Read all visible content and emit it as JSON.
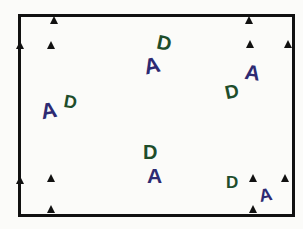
{
  "diagram": {
    "frame": {
      "left": 18,
      "top": 14,
      "width": 271,
      "height": 197,
      "color": "#111111"
    },
    "colors": {
      "A": "#2d2a72",
      "D": "#1e4d2b"
    },
    "markers": [
      {
        "x": 54,
        "y": 16
      },
      {
        "x": 20,
        "y": 41
      },
      {
        "x": 51,
        "y": 41
      },
      {
        "x": 249,
        "y": 16
      },
      {
        "x": 288,
        "y": 40
      },
      {
        "x": 250,
        "y": 40
      },
      {
        "x": 20,
        "y": 176
      },
      {
        "x": 51,
        "y": 174
      },
      {
        "x": 51,
        "y": 205
      },
      {
        "x": 253,
        "y": 174
      },
      {
        "x": 285,
        "y": 174
      },
      {
        "x": 253,
        "y": 205
      }
    ],
    "letters": [
      {
        "text": "A",
        "x": 41,
        "y": 100,
        "rotate": -10,
        "size": 22,
        "color_key": "A"
      },
      {
        "text": "D",
        "x": 64,
        "y": 93,
        "rotate": 10,
        "size": 18,
        "color_key": "D"
      },
      {
        "text": "A",
        "x": 144,
        "y": 55,
        "rotate": -12,
        "size": 22,
        "color_key": "A"
      },
      {
        "text": "D",
        "x": 157,
        "y": 33,
        "rotate": 12,
        "size": 20,
        "color_key": "D"
      },
      {
        "text": "D",
        "x": 225,
        "y": 82,
        "rotate": -12,
        "size": 19,
        "color_key": "D"
      },
      {
        "text": "A",
        "x": 245,
        "y": 62,
        "rotate": 8,
        "size": 21,
        "color_key": "A"
      },
      {
        "text": "D",
        "x": 143,
        "y": 142,
        "rotate": 0,
        "size": 20,
        "color_key": "D"
      },
      {
        "text": "A",
        "x": 147,
        "y": 165,
        "rotate": 0,
        "size": 21,
        "color_key": "A"
      },
      {
        "text": "D",
        "x": 226,
        "y": 174,
        "rotate": 0,
        "size": 17,
        "color_key": "D"
      },
      {
        "text": "A",
        "x": 259,
        "y": 186,
        "rotate": -10,
        "size": 18,
        "color_key": "A"
      }
    ]
  }
}
